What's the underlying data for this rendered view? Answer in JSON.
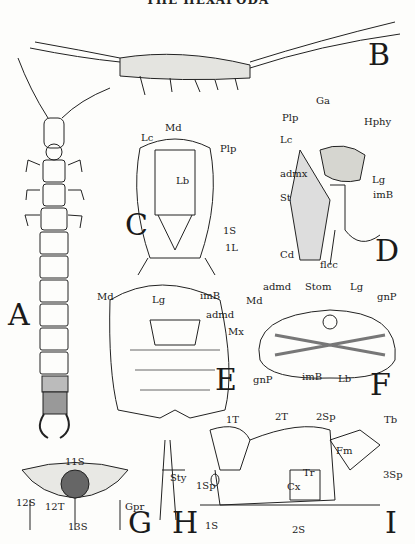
{
  "running_head": "THE HEXAPODA",
  "figures": {
    "A": {
      "letter": "A"
    },
    "B": {
      "letter": "B"
    },
    "C": {
      "letter": "C",
      "labels": [
        "Md",
        "Lc",
        "Plp",
        "Lb",
        "1S",
        "1L"
      ]
    },
    "D": {
      "letter": "D",
      "labels": [
        "Plp",
        "Ga",
        "Hphy",
        "Lc",
        "admx",
        "St",
        "Lg",
        "imB",
        "Cd",
        "flcc"
      ]
    },
    "E": {
      "letter": "E",
      "labels": [
        "Md",
        "Lg",
        "imB",
        "admd"
      ]
    },
    "F": {
      "letter": "F",
      "labels": [
        "admd",
        "Stom",
        "Lg",
        "gnP",
        "Md",
        "Mx",
        "gnP",
        "imB",
        "Lb"
      ]
    },
    "G": {
      "letter": "G",
      "labels": [
        "11S",
        "12S",
        "12T",
        "13S",
        "Gpr"
      ]
    },
    "H": {
      "letter": "H",
      "labels": [
        "Sty"
      ]
    },
    "I": {
      "letter": "I",
      "labels": [
        "1T",
        "2T",
        "2Sp",
        "Tb",
        "Fm",
        "Tr",
        "Cx",
        "3Sp",
        "1Sp",
        "1S",
        "2S"
      ]
    }
  }
}
